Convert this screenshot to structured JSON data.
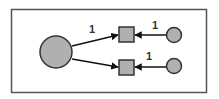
{
  "diagram": {
    "colors": {
      "frame": "#555555",
      "node_fill": "#b0b0b0",
      "node_stroke": "#333333",
      "edge": "#111111"
    },
    "nodes": [
      {
        "id": "big-circle",
        "shape": "circle",
        "cx": 56,
        "cy": 52,
        "r": 16
      },
      {
        "id": "square-top",
        "shape": "square",
        "x": 119,
        "y": 27,
        "size": 15
      },
      {
        "id": "square-bottom",
        "shape": "square",
        "x": 119,
        "y": 60,
        "size": 15
      },
      {
        "id": "small-circle-top",
        "shape": "circle",
        "cx": 174,
        "cy": 35,
        "r": 7.5
      },
      {
        "id": "small-circle-bottom",
        "shape": "circle",
        "cx": 174,
        "cy": 66,
        "r": 7.5
      }
    ],
    "edges": [
      {
        "from": "big-circle",
        "to": "square-top",
        "label": "1"
      },
      {
        "from": "big-circle",
        "to": "square-bottom",
        "label": ""
      },
      {
        "from": "small-circle-top",
        "to": "square-top",
        "label": "1"
      },
      {
        "from": "small-circle-bottom",
        "to": "square-bottom",
        "label": "1"
      }
    ],
    "labels": {
      "edge_big_to_top": "1",
      "edge_small_top": "1",
      "edge_small_bottom": "1"
    }
  }
}
